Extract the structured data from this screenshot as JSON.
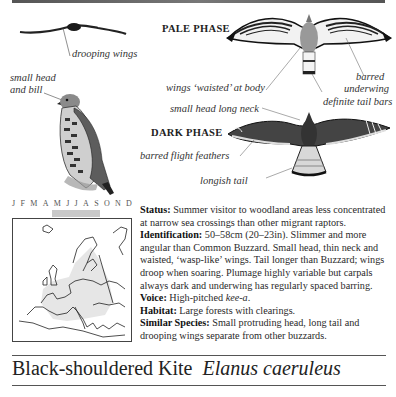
{
  "illustrations": {
    "silhouette_label": "drooping wings",
    "perched_label": "small head\nand bill",
    "perched_label_line1": "small head",
    "perched_label_line2": "and bill",
    "pale_phase": {
      "heading": "PALE PHASE",
      "labels": [
        "wings ‘waisted’ at body",
        "barred",
        "underwing",
        "definite tail bars"
      ]
    },
    "dark_phase": {
      "heading": "DARK PHASE",
      "labels": [
        "small head long neck",
        "barred flight feathers",
        "longish tail"
      ]
    }
  },
  "calendar": {
    "months": [
      "J",
      "F",
      "M",
      "A",
      "M",
      "J",
      "J",
      "A",
      "S",
      "O",
      "N",
      "D"
    ],
    "present_months": [
      "M",
      "J",
      "J",
      "A"
    ],
    "bar_color": "#c9c9c9"
  },
  "description": {
    "status_label": "Status:",
    "status_text": " Summer visitor to woodland areas less concentrated at narrow sea crossings than other migrant raptors.",
    "identification_label": "Identification:",
    "identification_text": " 50–58cm (20–23in). Slimmer and more angular than Common Buzzard. Small head, thin neck and waisted, ‘wasp-like’ wings. Tail longer than Buzzard; wings droop when soaring. Plumage highly variable but carpals always dark and underwing has regularly spaced barring.",
    "voice_label": "Voice:",
    "voice_text_prefix": " High-pitched ",
    "voice_call": "kee-a",
    "voice_text_suffix": ".",
    "habitat_label": "Habitat:",
    "habitat_text": " Large forests with clearings.",
    "similar_label": "Similar Species:",
    "similar_text": " Small protruding head, long tail and drooping wings separate from other buzzards."
  },
  "footer": {
    "common_name": "Black-shouldered Kite",
    "scientific_name": "Elanus caeruleus"
  }
}
